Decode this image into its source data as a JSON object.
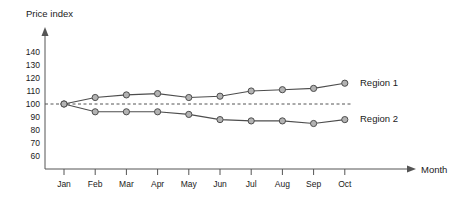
{
  "chart_data": {
    "type": "line",
    "title": "",
    "ylabel": "Price index",
    "xlabel": "Month",
    "categories": [
      "Jan",
      "Feb",
      "Mar",
      "Apr",
      "May",
      "Jun",
      "Jul",
      "Aug",
      "Sep",
      "Oct"
    ],
    "ylim": [
      60,
      140
    ],
    "yticks": [
      60,
      70,
      80,
      90,
      100,
      110,
      120,
      130,
      140
    ],
    "grid": false,
    "legend_position": "right-inline",
    "reference_line": {
      "value": 100,
      "style": "dashed"
    },
    "series": [
      {
        "name": "Region 1",
        "values": [
          100,
          105,
          107,
          108,
          105,
          106,
          110,
          111,
          112,
          116
        ],
        "color": "#4d4d4d",
        "marker": "circle"
      },
      {
        "name": "Region 2",
        "values": [
          100,
          94,
          94,
          94,
          92,
          88,
          87,
          87,
          85,
          88
        ],
        "color": "#4d4d4d",
        "marker": "circle"
      }
    ]
  },
  "labels": {
    "y_axis_title": "Price index",
    "x_axis_title": "Month",
    "series_1": "Region 1",
    "series_2": "Region 2"
  },
  "y_tick_text": [
    "140",
    "130",
    "120",
    "110",
    "100",
    "90",
    "80",
    "70",
    "60"
  ],
  "colors": {
    "axis": "#555555",
    "line": "#4d4d4d",
    "marker_fill": "#b3b3b3",
    "text": "#1a1a1a",
    "background": "#ffffff"
  }
}
